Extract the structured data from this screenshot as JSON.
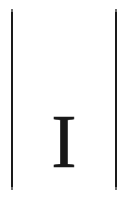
{
  "page": {
    "width": 128,
    "height": 199,
    "background_color": "#ffffff",
    "ink_color": "#181818"
  },
  "rules": {
    "color": "#1a1a1a",
    "left": {
      "name": "left column rule"
    },
    "right": {
      "name": "right column rule"
    }
  },
  "content": {
    "letter": "I"
  }
}
